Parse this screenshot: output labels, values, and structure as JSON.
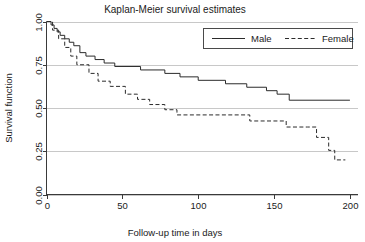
{
  "chart_data": {
    "type": "line",
    "subtype": "kaplan-meier-step",
    "title": "Kaplan-Meier survival estimates",
    "xlabel": "Follow-up time in days",
    "ylabel": "Survival function",
    "xlim": [
      0,
      205
    ],
    "ylim": [
      0,
      1.0
    ],
    "xticks": [
      0,
      50,
      100,
      150,
      200
    ],
    "xtick_labels": [
      "0",
      "50",
      "100",
      "150",
      "200"
    ],
    "yticks": [
      0.0,
      0.25,
      0.5,
      0.75,
      1.0
    ],
    "ytick_labels": [
      "0.00",
      "0.25",
      "0.50",
      "0.75",
      "1.00"
    ],
    "grid": true,
    "grid_axis": "y",
    "legend_position": "top-right",
    "legend_entries": [
      "Male",
      "Female"
    ],
    "series": [
      {
        "name": "Male",
        "linestyle": "solid",
        "color": "#2b2b2b",
        "steps": [
          [
            0,
            1.0
          ],
          [
            3,
            0.98
          ],
          [
            5,
            0.96
          ],
          [
            7,
            0.94
          ],
          [
            9,
            0.92
          ],
          [
            12,
            0.9
          ],
          [
            15,
            0.88
          ],
          [
            18,
            0.86
          ],
          [
            22,
            0.82
          ],
          [
            26,
            0.8
          ],
          [
            32,
            0.78
          ],
          [
            38,
            0.76
          ],
          [
            45,
            0.74
          ],
          [
            62,
            0.72
          ],
          [
            78,
            0.7
          ],
          [
            88,
            0.68
          ],
          [
            100,
            0.66
          ],
          [
            118,
            0.64
          ],
          [
            132,
            0.62
          ],
          [
            145,
            0.6
          ],
          [
            152,
            0.58
          ],
          [
            160,
            0.545
          ],
          [
            200,
            0.545
          ]
        ]
      },
      {
        "name": "Female",
        "linestyle": "dashed",
        "color": "#2b2b2b",
        "steps": [
          [
            0,
            1.0
          ],
          [
            4,
            0.95
          ],
          [
            8,
            0.9
          ],
          [
            12,
            0.85
          ],
          [
            16,
            0.8
          ],
          [
            20,
            0.75
          ],
          [
            28,
            0.7
          ],
          [
            34,
            0.655
          ],
          [
            42,
            0.625
          ],
          [
            52,
            0.58
          ],
          [
            60,
            0.55
          ],
          [
            68,
            0.52
          ],
          [
            78,
            0.49
          ],
          [
            86,
            0.46
          ],
          [
            128,
            0.46
          ],
          [
            134,
            0.425
          ],
          [
            152,
            0.425
          ],
          [
            158,
            0.39
          ],
          [
            172,
            0.39
          ],
          [
            178,
            0.33
          ],
          [
            186,
            0.255
          ],
          [
            190,
            0.2
          ],
          [
            197,
            0.2
          ]
        ]
      }
    ]
  }
}
